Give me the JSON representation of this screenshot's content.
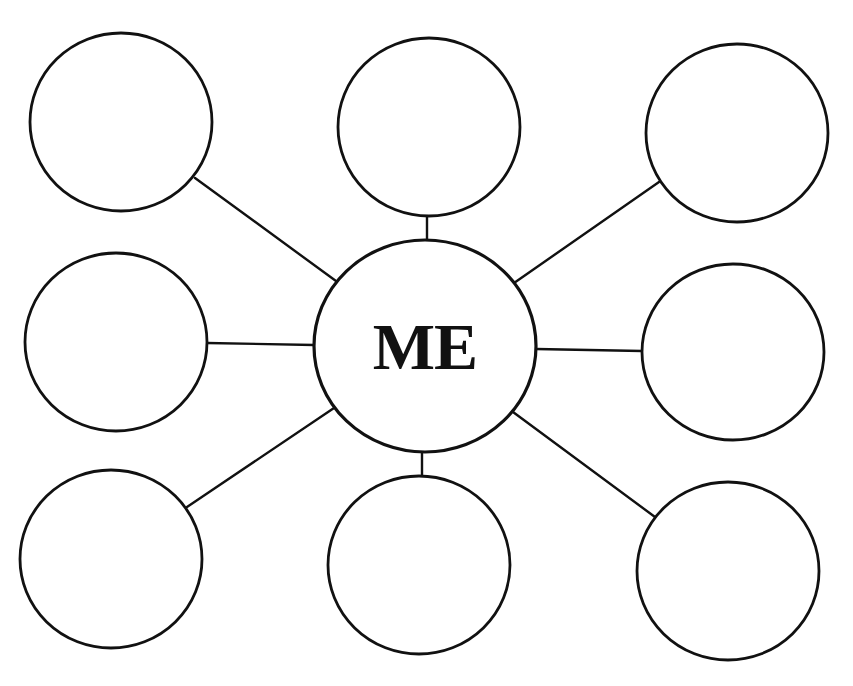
{
  "diagram": {
    "type": "mind-map",
    "center": {
      "label": "ME",
      "cx": 425,
      "cy": 346,
      "rx": 111,
      "ry": 106
    },
    "nodes": [
      {
        "id": "top-left",
        "label": "",
        "cx": 121,
        "cy": 122,
        "rx": 91,
        "ry": 89,
        "edge": [
          195,
          178,
          336,
          281
        ]
      },
      {
        "id": "top-middle",
        "label": "",
        "cx": 429,
        "cy": 127,
        "rx": 91,
        "ry": 89,
        "edge": [
          427,
          216,
          427,
          240
        ]
      },
      {
        "id": "top-right",
        "label": "",
        "cx": 737,
        "cy": 133,
        "rx": 91,
        "ry": 89,
        "edge": [
          659,
          182,
          514,
          283
        ]
      },
      {
        "id": "middle-left",
        "label": "",
        "cx": 116,
        "cy": 342,
        "rx": 91,
        "ry": 89,
        "edge": [
          207,
          343,
          314,
          345
        ]
      },
      {
        "id": "middle-right",
        "label": "",
        "cx": 733,
        "cy": 352,
        "rx": 91,
        "ry": 88,
        "edge": [
          536,
          349,
          642,
          351
        ]
      },
      {
        "id": "bottom-left",
        "label": "",
        "cx": 111,
        "cy": 559,
        "rx": 91,
        "ry": 89,
        "edge": [
          187,
          507,
          334,
          408
        ]
      },
      {
        "id": "bottom-middle",
        "label": "",
        "cx": 419,
        "cy": 565,
        "rx": 91,
        "ry": 89,
        "edge": [
          422,
          452,
          422,
          476
        ]
      },
      {
        "id": "bottom-right",
        "label": "",
        "cx": 728,
        "cy": 571,
        "rx": 91,
        "ry": 89,
        "edge": [
          655,
          517,
          513,
          412
        ]
      }
    ],
    "colors": {
      "stroke": "#111111",
      "fill": "#ffffff",
      "background": "#ffffff"
    }
  }
}
